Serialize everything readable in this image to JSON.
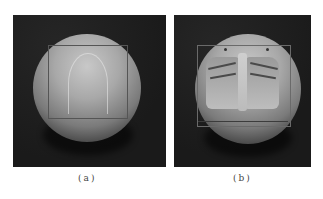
{
  "figure": {
    "panels": [
      {
        "id": "a",
        "caption": "(a)",
        "description": "shaded sphere with rectangular projection frame and faint arc highlight"
      },
      {
        "id": "b",
        "caption": "(b)",
        "description": "shaded sphere with chest X-ray texture mapped inside frame"
      }
    ]
  },
  "colors": {
    "background": "#1c1c1c",
    "sphere_highlight": "#c8c8c8",
    "caption": "#444444"
  }
}
